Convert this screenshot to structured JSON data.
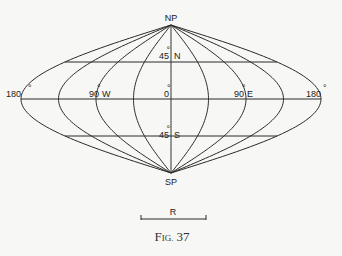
{
  "figure": {
    "caption_prefix": "F",
    "caption_small": "IG.",
    "caption_number": "37",
    "projection": "sinusoidal",
    "meridian_step_deg": 45,
    "parallels_deg": [
      45,
      0,
      -45
    ],
    "line_color": "#2a2a2a",
    "background_color": "#f7f7f5"
  },
  "labels": {
    "north_pole": "NP",
    "south_pole": "SP",
    "lat_45n_num": "45",
    "lat_45n_dir": "N",
    "lat_45s_num": "45",
    "lat_45s_dir": "S",
    "lon_180w": "180",
    "lon_90w_num": "90",
    "lon_90w_dir": "W",
    "lon_0": "0",
    "lon_90e_num": "90",
    "lon_90e_dir": "E",
    "lon_180e": "180",
    "degree": "°"
  },
  "scale_bar": {
    "label": "R"
  }
}
